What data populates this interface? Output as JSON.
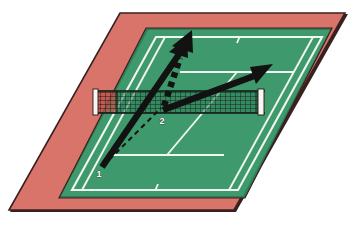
{
  "figure": {
    "type": "tennis-court-perspective-diagram",
    "background_color": "#ffffff"
  },
  "colors": {
    "surround_red": "#d9746b",
    "surround_red_shadow": "#c2554c",
    "court_green": "#3e9a6d",
    "court_green_dark": "#2f7d57",
    "court_line_white": "#f2f6f0",
    "outline_dark": "#3a2020",
    "net_dark": "#1b2d22",
    "net_post_white": "#f6f6f4",
    "arrow_black": "#121212",
    "label_white": "#ffffff"
  },
  "labels": {
    "point_one": "1",
    "point_two": "2"
  },
  "court": {
    "surface": "green hard court",
    "surround": "red run-off apron",
    "lines": [
      "baseline-far",
      "baseline-near",
      "doubles-sideline-left",
      "doubles-sideline-right",
      "singles-sideline-left",
      "singles-sideline-right",
      "service-line-far",
      "service-line-near",
      "center-service-line",
      "center-mark-far",
      "center-mark-near"
    ],
    "net": {
      "present": true,
      "mesh": "grid",
      "posts": 2
    }
  },
  "annotations": {
    "arrows": [
      {
        "name": "solid-arrow-forward",
        "style": "solid",
        "description": "Thick solid arrow from point 1 running forward through the net toward the far court",
        "from_label": "1",
        "to_label": ""
      },
      {
        "name": "dotted-arrow-parallel",
        "style": "dotted",
        "description": "Dotted thick arrow parallel to the solid forward arrow",
        "from_label": "",
        "to_label": ""
      },
      {
        "name": "solid-arrow-diagonal",
        "style": "solid",
        "description": "Thick solid arrow from point 2 angling up and to the right across the far court",
        "from_label": "2",
        "to_label": ""
      }
    ],
    "dashed_path": {
      "name": "dashed-recovery-path",
      "style": "dashed",
      "description": "Thin dashed line connecting point 1 to point 2",
      "from_label": "1",
      "to_label": "2"
    }
  }
}
